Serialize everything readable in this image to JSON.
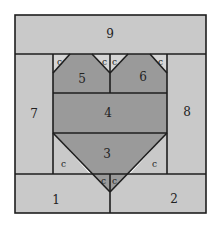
{
  "diagram": {
    "colors": {
      "light": "#c9c9c9",
      "medium": "#9a9a9a",
      "corner": "#d6d6d6",
      "line": "#1e1e1e"
    },
    "pieces": [
      {
        "id": "1",
        "label": "1",
        "shade": "light"
      },
      {
        "id": "2",
        "label": "2",
        "shade": "light"
      },
      {
        "id": "3",
        "label": "3",
        "shade": "medium"
      },
      {
        "id": "4",
        "label": "4",
        "shade": "medium"
      },
      {
        "id": "5",
        "label": "5",
        "shade": "medium"
      },
      {
        "id": "6",
        "label": "6",
        "shade": "medium"
      },
      {
        "id": "7",
        "label": "7",
        "shade": "light"
      },
      {
        "id": "8",
        "label": "8",
        "shade": "light"
      },
      {
        "id": "9",
        "label": "9",
        "shade": "light"
      }
    ],
    "corner_label": "c"
  }
}
